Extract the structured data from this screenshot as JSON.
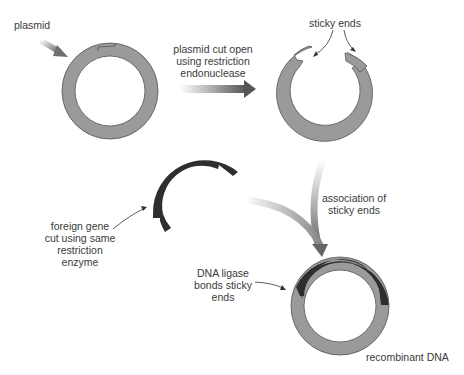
{
  "labels": {
    "plasmid": "plasmid",
    "cut_step": [
      "plasmid cut open",
      "using restriction",
      "endonuclease"
    ],
    "sticky_ends": "sticky ends",
    "foreign_gene": [
      "foreign gene",
      "cut using same",
      "restriction",
      "enzyme"
    ],
    "association": [
      "association of",
      "sticky ends"
    ],
    "ligase": [
      "DNA ligase",
      "bonds sticky",
      "ends"
    ],
    "recombinant": "recombinant DNA"
  },
  "colors": {
    "plasmid_fill": "#9a9a9a",
    "foreign_fill": "#2e2e2e",
    "outline": "#555555",
    "text": "#3a3a3a"
  }
}
